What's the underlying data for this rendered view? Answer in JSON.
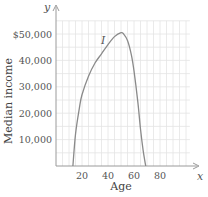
{
  "chart_data": {
    "type": "line",
    "title": "",
    "xlabel": "Age",
    "ylabel": "Median income",
    "x_axis_symbol": "x",
    "y_axis_symbol": "y",
    "curve_label": "I",
    "xlim": [
      0,
      105
    ],
    "ylim": [
      0,
      55000
    ],
    "x_ticks": [
      20,
      40,
      60,
      80
    ],
    "x_tick_labels": [
      "20",
      "40",
      "60",
      "80"
    ],
    "y_ticks": [
      10000,
      20000,
      30000,
      40000,
      50000
    ],
    "y_tick_labels": [
      "10,000",
      "20,000",
      "30,000",
      "40,000",
      "$50,000"
    ],
    "grid": true,
    "grid_x_step": 5,
    "grid_y_step": 5000,
    "series": [
      {
        "name": "I",
        "x": [
          13,
          15,
          18,
          20,
          25,
          30,
          35,
          40,
          45,
          50,
          52,
          55,
          58,
          60,
          63,
          65,
          67,
          69
        ],
        "values": [
          0,
          12000,
          22000,
          27000,
          34000,
          39000,
          42500,
          46000,
          49000,
          50500,
          50000,
          47500,
          42000,
          36000,
          24000,
          14000,
          6000,
          0
        ]
      }
    ],
    "colors": {
      "curve": "#8a8a8a",
      "grid": "#e4e4e4",
      "axis": "#9a9a9a"
    }
  }
}
